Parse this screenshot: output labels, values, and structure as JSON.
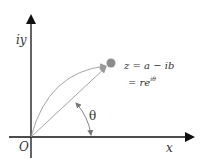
{
  "diagram": {
    "axes": {
      "y_label": "iy",
      "x_label": "x",
      "origin_label": "O"
    },
    "point": {
      "label_line1": "z = a − ib",
      "label_line2_prefix": "= re",
      "label_line2_exponent": "iθ",
      "color": "#8c8c8c"
    },
    "angle_label": "θ",
    "colors": {
      "axis": "#111111",
      "vector": "#9a9a9a",
      "arc": "#9a9a9a",
      "angle_arc": "#777777",
      "text": "#333333"
    }
  }
}
